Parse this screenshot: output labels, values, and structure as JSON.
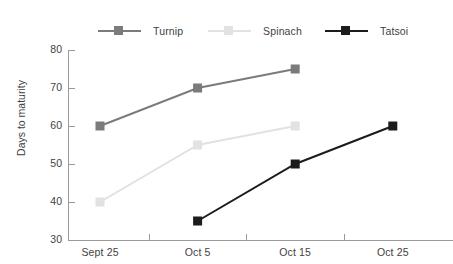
{
  "chart_data": {
    "type": "line",
    "title": "",
    "xlabel": "",
    "ylabel": "Days to maturity",
    "categories": [
      "Sept 25",
      "Oct 5",
      "Oct 15",
      "Oct 25"
    ],
    "ylim": [
      30,
      80
    ],
    "yticks": [
      30,
      40,
      50,
      60,
      70,
      80
    ],
    "grid": false,
    "legend_position": "top",
    "series": [
      {
        "name": "Turnip",
        "color": "#7b7b7b",
        "values": [
          60,
          70,
          75,
          null
        ]
      },
      {
        "name": "Spinach",
        "color": "#e2e2e2",
        "values": [
          40,
          55,
          60,
          null
        ]
      },
      {
        "name": "Tatsoi",
        "color": "#1c1c1c",
        "values": [
          null,
          35,
          50,
          60
        ]
      }
    ]
  },
  "axis": {
    "y_tick_labels": [
      "80",
      "70",
      "60",
      "50",
      "40",
      "30"
    ],
    "y_title": "Days to maturity",
    "x_tick_labels": [
      "Sept 25",
      "Oct 5",
      "Oct 15",
      "Oct 25"
    ],
    "axis_color": "#9a9a9a"
  },
  "legend": {
    "items": [
      {
        "label": "Turnip",
        "color": "#7b7b7b"
      },
      {
        "label": "Spinach",
        "color": "#e2e2e2"
      },
      {
        "label": "Tatsoi",
        "color": "#1c1c1c"
      }
    ]
  }
}
